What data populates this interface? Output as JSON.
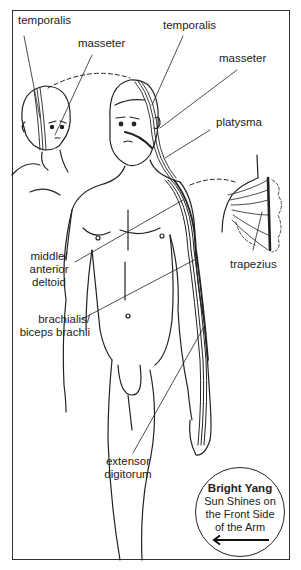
{
  "diagram": {
    "type": "anatomical-meridian-diagram",
    "labels": {
      "temporalis_left": "temporalis",
      "masseter_left": "masseter",
      "temporalis_right": "temporalis",
      "masseter_right": "masseter",
      "platysma": "platysma",
      "deltoid_line1": "middle/",
      "deltoid_line2": "anterior",
      "deltoid_line3": "deltoid",
      "trapezius": "trapezius",
      "brachialis_line1": "brachialis/",
      "brachialis_line2": "biceps brachii",
      "extensor_line1": "extensor",
      "extensor_line2": "digitorum"
    },
    "badge": {
      "title": "Bright Yang",
      "line1": "Sun Shines on",
      "line2": "the Front Side",
      "line3": "of the Arm",
      "arrow_icon": "arrow-left-icon"
    },
    "colors": {
      "ink": "#222222",
      "background": "#ffffff"
    }
  }
}
